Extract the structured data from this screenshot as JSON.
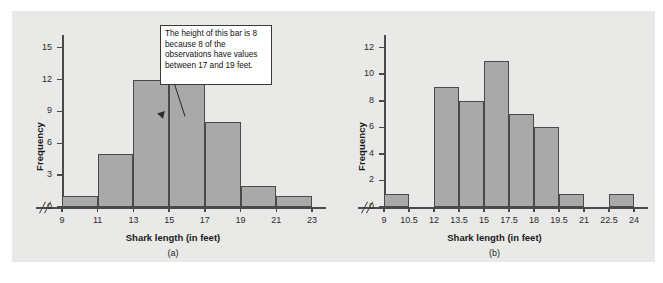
{
  "figure": {
    "background_color": "#ffffff",
    "panel_color": "#e9e9e7",
    "bar_fill_color": "#a9a9a9",
    "bar_border_color": "#4a4a4a",
    "axis_color": "#4a4a4a"
  },
  "chart_data": [
    {
      "type": "bar",
      "id": "a",
      "caption": "(a)",
      "title": "",
      "xlabel": "Shark length (in feet)",
      "ylabel": "Frequency",
      "xtick_labels": [
        "9",
        "11",
        "13",
        "15",
        "17",
        "19",
        "21",
        "23"
      ],
      "xticks": [
        9,
        11,
        13,
        15,
        17,
        19,
        21,
        23
      ],
      "ytick_labels": [
        "0",
        "3",
        "6",
        "9",
        "12",
        "15"
      ],
      "yticks": [
        0,
        3,
        6,
        9,
        12,
        15
      ],
      "ylim": [
        0,
        16
      ],
      "xlim": [
        9,
        23
      ],
      "grid": false,
      "axis_break_x": true,
      "bin_edges": [
        9,
        11,
        13,
        15,
        17,
        19,
        21,
        23
      ],
      "values": [
        1,
        5,
        12,
        15,
        8,
        2,
        1
      ],
      "bins": [
        {
          "from": 9,
          "to": 11,
          "frequency": 1
        },
        {
          "from": 11,
          "to": 13,
          "frequency": 5
        },
        {
          "from": 13,
          "to": 15,
          "frequency": 12
        },
        {
          "from": 15,
          "to": 17,
          "frequency": 15
        },
        {
          "from": 17,
          "to": 19,
          "frequency": 8
        },
        {
          "from": 19,
          "to": 21,
          "frequency": 2
        },
        {
          "from": 21,
          "to": 23,
          "frequency": 1
        }
      ],
      "annotation": "The height of this bar is 8 because 8 of the observations have values between 17 and 19 feet."
    },
    {
      "type": "bar",
      "id": "b",
      "caption": "(b)",
      "title": "",
      "xlabel": "Shark length (in feet)",
      "ylabel": "Frequency",
      "xtick_labels": [
        "9",
        "10.5",
        "12",
        "13.5",
        "15",
        "17.5",
        "18",
        "19.5",
        "21",
        "22.5",
        "24"
      ],
      "xticks": [
        9,
        10.5,
        12,
        13.5,
        15,
        16.5,
        18,
        19.5,
        21,
        22.5,
        24
      ],
      "ytick_labels": [
        "0",
        "2",
        "4",
        "6",
        "8",
        "10",
        "12"
      ],
      "yticks": [
        0,
        2,
        4,
        6,
        8,
        10,
        12
      ],
      "ylim": [
        0,
        12.8
      ],
      "xlim": [
        9,
        24
      ],
      "grid": false,
      "axis_break_x": true,
      "bin_edges": [
        9,
        10.5,
        12,
        13.5,
        15,
        16.5,
        18,
        19.5,
        21,
        22.5,
        24
      ],
      "values": [
        1,
        0,
        9,
        8,
        11,
        7,
        6,
        1,
        0,
        1
      ],
      "bins": [
        {
          "from": 9,
          "to": 10.5,
          "frequency": 1
        },
        {
          "from": 10.5,
          "to": 12,
          "frequency": 0
        },
        {
          "from": 12,
          "to": 13.5,
          "frequency": 9
        },
        {
          "from": 13.5,
          "to": 15,
          "frequency": 8
        },
        {
          "from": 15,
          "to": 16.5,
          "frequency": 11
        },
        {
          "from": 16.5,
          "to": 18,
          "frequency": 7
        },
        {
          "from": 18,
          "to": 19.5,
          "frequency": 6
        },
        {
          "from": 19.5,
          "to": 21,
          "frequency": 1
        },
        {
          "from": 21,
          "to": 22.5,
          "frequency": 0
        },
        {
          "from": 22.5,
          "to": 24,
          "frequency": 1
        }
      ]
    }
  ]
}
